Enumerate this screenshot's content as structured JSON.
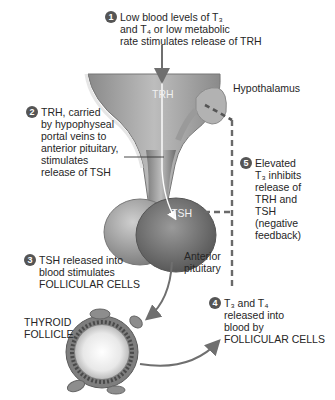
{
  "diagram": {
    "colors": {
      "badge": "#555555",
      "tissue_dark": "#6e6e6e",
      "tissue_light": "#d6d6d6",
      "arrow": "#707070",
      "dashed_feedback": "#6a6a6a"
    },
    "structure_labels": {
      "hypothalamus": "Hypothalamus",
      "trh": "TRH",
      "tsh": "TSH",
      "anterior_pituitary_line1": "Anterior",
      "anterior_pituitary_line2": "pituitary",
      "thyroid_follicle_line1": "THYROID",
      "thyroid_follicle_line2": "FOLLICLE"
    },
    "steps": [
      {
        "number": "1",
        "lines": [
          "Low blood levels of T₃",
          "and T₄ or low metabolic",
          "rate stimulates release of TRH"
        ]
      },
      {
        "number": "2",
        "lines": [
          "TRH, carried",
          "by hypophyseal",
          "portal veins to",
          "anterior pituitary,",
          "stimulates",
          "release of TSH"
        ]
      },
      {
        "number": "3",
        "lines": [
          "TSH released into",
          "blood stimulates",
          "FOLLICULAR CELLS"
        ]
      },
      {
        "number": "4",
        "lines": [
          "T₃ and T₄",
          "released into",
          "blood by",
          "FOLLICULAR CELLS"
        ]
      },
      {
        "number": "5",
        "lines": [
          "Elevated",
          "T₃ inhibits",
          "release of",
          "TRH and",
          "TSH",
          "(negative",
          "feedback)"
        ]
      }
    ]
  }
}
